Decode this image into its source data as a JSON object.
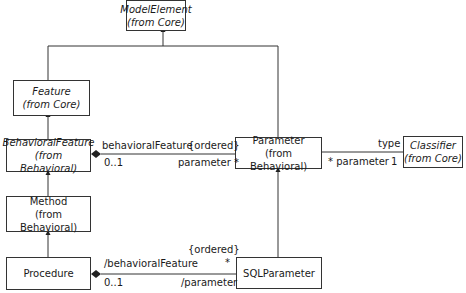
{
  "classes": {
    "model_element": {
      "name": "ModelElement",
      "package": "(from Core)",
      "abstract": true
    },
    "feature": {
      "name": "Feature",
      "package": "(from Core)",
      "abstract": true
    },
    "behavioral_feature": {
      "name": "BehavioralFeature",
      "package": "(from Behavioral)",
      "abstract": true
    },
    "method": {
      "name": "Method",
      "package": "(from Behavioral)",
      "abstract": false
    },
    "procedure": {
      "name": "Procedure",
      "abstract": false
    },
    "parameter": {
      "name": "Parameter",
      "package": "(from Behavioral)",
      "abstract": false
    },
    "classifier": {
      "name": "Classifier",
      "package": "(from Core)",
      "abstract": true
    },
    "sql_parameter": {
      "name": "SQLParameter",
      "abstract": false
    }
  },
  "associations": {
    "bf_param": {
      "source_role": "behavioralFeature",
      "constraint": "{ordered}",
      "source_mult": "0..1",
      "target_role": "parameter *",
      "kind": "composition"
    },
    "param_classifier": {
      "source_role": "* parameter",
      "target_role": "type",
      "target_mult": "1"
    },
    "proc_sqlparam": {
      "source_role": "/behavioralFeature",
      "constraint": "{ordered}",
      "target_mult": "*",
      "source_mult": "0..1",
      "target_role": "/parameter",
      "kind": "composition"
    }
  },
  "generalizations": [
    {
      "child": "Feature",
      "parent": "ModelElement"
    },
    {
      "child": "Parameter",
      "parent": "ModelElement"
    },
    {
      "child": "BehavioralFeature",
      "parent": "Feature"
    },
    {
      "child": "Method",
      "parent": "BehavioralFeature"
    },
    {
      "child": "Procedure",
      "parent": "Method"
    },
    {
      "child": "SQLParameter",
      "parent": "Parameter"
    }
  ]
}
